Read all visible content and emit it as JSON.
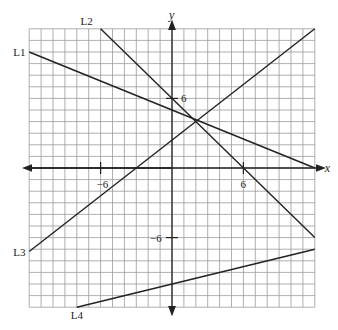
{
  "chart_data": {
    "type": "line",
    "title": "",
    "xlabel": "x",
    "ylabel": "y",
    "xlim": [
      -12,
      12
    ],
    "ylim": [
      -12,
      12
    ],
    "grid": true,
    "x_ticks_labeled": [
      {
        "value": -6,
        "label": "−6"
      },
      {
        "value": 6,
        "label": "6"
      }
    ],
    "y_ticks_labeled": [
      {
        "value": 6,
        "label": "6"
      },
      {
        "value": -6,
        "label": "−6"
      }
    ],
    "series": [
      {
        "name": "L1",
        "points": [
          [
            -12,
            10
          ],
          [
            12,
            0
          ]
        ]
      },
      {
        "name": "L2",
        "points": [
          [
            -6,
            12
          ],
          [
            12,
            -6
          ]
        ]
      },
      {
        "name": "L3",
        "points": [
          [
            -12,
            -7.2
          ],
          [
            12,
            12
          ]
        ]
      },
      {
        "name": "L4",
        "points": [
          [
            -8,
            -12
          ],
          [
            12,
            -7
          ]
        ]
      }
    ],
    "annotations": [
      "L1",
      "L2",
      "L3",
      "L4"
    ]
  }
}
